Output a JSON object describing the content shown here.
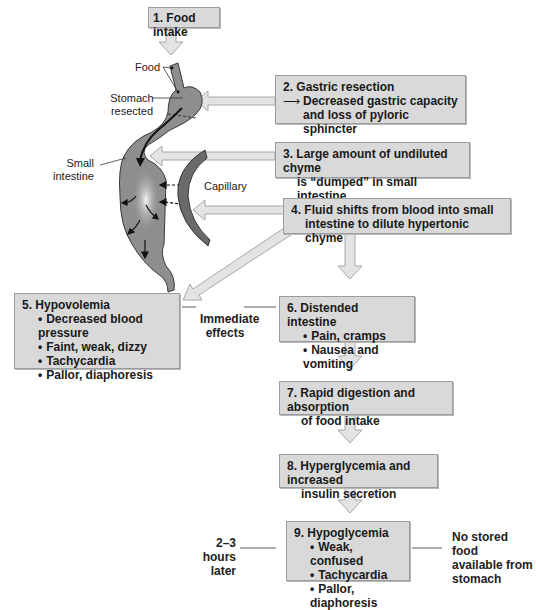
{
  "steps": {
    "s1": {
      "title": "1. Food intake"
    },
    "s2": {
      "title": "2. Gastric resection",
      "line1": "Decreased gastric capacity",
      "line2": "and loss of pyloric sphincter"
    },
    "s3": {
      "line1": "3. Large amount of undiluted chyme",
      "line2": "is “dumped” in small intestine"
    },
    "s4": {
      "line1": "4. Fluid shifts from blood into small",
      "line2": "intestine to dilute hypertonic chyme"
    },
    "s5": {
      "title": "5. Hypovolemia",
      "items": [
        "Decreased blood pressure",
        "Faint, weak, dizzy",
        "Tachycardia",
        "Pallor, diaphoresis"
      ]
    },
    "s6": {
      "title": "6. Distended intestine",
      "items": [
        "Pain, cramps",
        "Nausea and vomiting"
      ]
    },
    "s7": {
      "line1": "7. Rapid digestion and absorption",
      "line2": "of food intake"
    },
    "s8": {
      "line1": "8. Hyperglycemia and increased",
      "line2": "insulin secretion"
    },
    "s9": {
      "title": "9. Hypoglycemia",
      "items": [
        "Weak, confused",
        "Tachycardia",
        "Pallor, diaphoresis"
      ]
    }
  },
  "labels": {
    "food": "Food",
    "stomach_1": "Stomach",
    "stomach_2": "resected",
    "small_1": "Small",
    "small_2": "intestine",
    "capillary": "Capillary",
    "immediate_1": "Immediate",
    "immediate_2": "effects",
    "later_1": "2–3 hours",
    "later_2": "later",
    "nostored_1": "No stored food",
    "nostored_2": "available from",
    "nostored_3": "stomach"
  },
  "colors": {
    "box_fill": "#d9d9d9",
    "arrow_fill": "#e3e3e3",
    "organ_fill": "#8e8e8e",
    "capillary_fill": "#6a6a6a"
  }
}
